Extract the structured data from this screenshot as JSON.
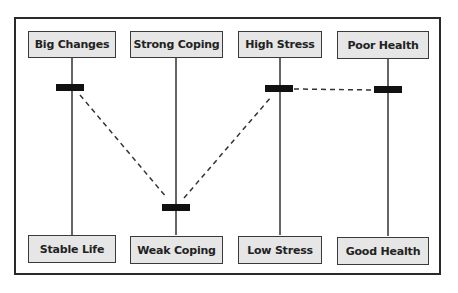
{
  "diagram": {
    "columns": [
      {
        "top_label": "Big Changes",
        "bottom_label": "Stable Life",
        "marker_position": "high"
      },
      {
        "top_label": "Strong Coping",
        "bottom_label": "Weak Coping",
        "marker_position": "low"
      },
      {
        "top_label": "High Stress",
        "bottom_label": "Low Stress",
        "marker_position": "high"
      },
      {
        "top_label": "Poor Health",
        "bottom_label": "Good Health",
        "marker_position": "high"
      }
    ],
    "connections": [
      {
        "from": "Big Changes marker",
        "to": "Weak Coping marker",
        "style": "dashed"
      },
      {
        "from": "Weak Coping marker",
        "to": "High Stress marker",
        "style": "dashed"
      },
      {
        "from": "High Stress marker",
        "to": "Poor Health marker",
        "style": "dashed"
      }
    ],
    "colors": {
      "box_fill": "#e6e6e6",
      "line": "#333333",
      "marker": "#111111"
    }
  }
}
